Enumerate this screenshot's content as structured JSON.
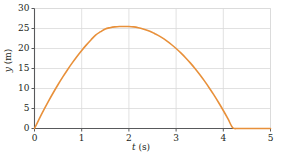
{
  "chart_data": {
    "type": "line",
    "title": "",
    "subtitle": "",
    "xlabel": "t (s)",
    "ylabel": "y (m)",
    "xlabel_var": "t",
    "xlabel_unit": "(s)",
    "ylabel_var": "y",
    "ylabel_unit": "(m)",
    "xlim": [
      0,
      5
    ],
    "ylim": [
      0,
      30
    ],
    "xticks": [
      0,
      1,
      2,
      3,
      4,
      5
    ],
    "yticks": [
      0,
      5,
      10,
      15,
      20,
      25,
      30
    ],
    "xtick_labels": [
      "0",
      "1",
      "2",
      "3",
      "4",
      "5"
    ],
    "ytick_labels": [
      "0",
      "5",
      "10",
      "15",
      "20",
      "25",
      "30"
    ],
    "grid": true,
    "grid_color": "#d9d9d9",
    "axis_color": "#58595b",
    "legend": null,
    "legend_position": "none",
    "series": [
      {
        "name": "projectile trajectory",
        "color": "#e8903a",
        "line_width": 1.6,
        "x": [
          0,
          0.1,
          0.2,
          0.3,
          0.4,
          0.5,
          0.6,
          0.7,
          0.8,
          0.9,
          1.0,
          1.1,
          1.2,
          1.3,
          1.4,
          1.5,
          1.6,
          1.7,
          1.8,
          1.9,
          2.0,
          2.1,
          2.2,
          2.3,
          2.4,
          2.5,
          2.55,
          2.6,
          2.7,
          2.8,
          2.9,
          3.0,
          3.1,
          3.2,
          3.3,
          3.4,
          3.5,
          3.6,
          3.7,
          3.8,
          3.9,
          4.0,
          4.1,
          4.2,
          4.3,
          4.4,
          4.5,
          4.6,
          4.7,
          4.8,
          4.9,
          5.0
        ],
        "y": [
          0,
          2.4,
          4.7,
          6.9,
          9.0,
          11.0,
          12.9,
          14.7,
          16.4,
          18.0,
          19.5,
          20.9,
          22.2,
          23.4,
          24.2,
          24.9,
          25.2,
          25.4,
          25.5,
          25.5,
          25.5,
          25.4,
          25.2,
          24.9,
          24.5,
          24.0,
          23.7,
          23.4,
          22.7,
          21.9,
          21.0,
          20.0,
          18.9,
          17.7,
          16.4,
          15.0,
          13.5,
          11.9,
          10.2,
          8.4,
          6.5,
          4.5,
          2.4,
          0.2,
          0,
          0,
          0,
          0,
          0,
          0,
          0,
          0
        ],
        "peak_x": 2.55,
        "peak_y": 25.5,
        "start_point": [
          0,
          0
        ],
        "end_point": [
          5,
          0
        ]
      }
    ]
  }
}
